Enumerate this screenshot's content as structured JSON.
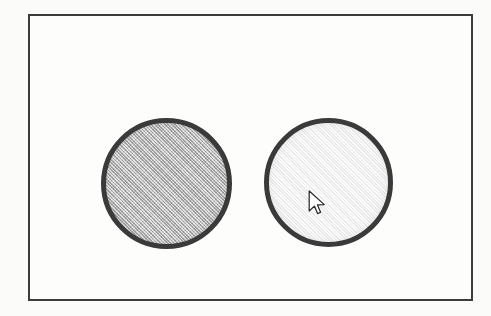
{
  "canvas": {
    "width": 491,
    "height": 316,
    "background_color": "#fbfbfa"
  },
  "frame": {
    "name": "bounding-frame",
    "border_color": "#3c3c3c",
    "border_width_px": 2,
    "fill_color": "#fdfdfc",
    "x": 28,
    "y": 14,
    "width": 445,
    "height": 287
  },
  "shapes": [
    {
      "id": "circle-left",
      "label": "left-circle",
      "shape": "circle",
      "fill_color": "#b6b6b6",
      "fill_style": "dithered-gray-halftone",
      "stroke_color": "#3a3a3a",
      "stroke_width_px": 5,
      "center_x": 166,
      "center_y": 183,
      "diameter_px": 131,
      "state": "unselected"
    },
    {
      "id": "circle-right",
      "label": "right-circle",
      "shape": "circle",
      "fill_color": "#f1f1f0",
      "fill_style": "near-white",
      "stroke_color": "#3a3a3a",
      "stroke_width_px": 5,
      "center_x": 328,
      "center_y": 182,
      "diameter_px": 129,
      "state": "hovered"
    }
  ],
  "cursor": {
    "name": "mouse-pointer",
    "type": "arrow",
    "fill_color": "#ffffff",
    "outline_color": "#2b2b2b",
    "hotspot_x": 310,
    "hotspot_y": 191,
    "over_shape": "circle-right"
  }
}
